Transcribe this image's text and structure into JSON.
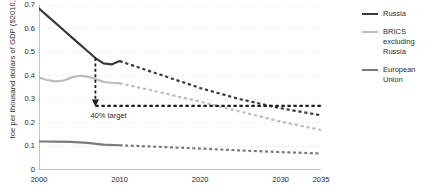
{
  "chart_data": {
    "type": "line",
    "title": "",
    "xlabel": "",
    "ylabel": "toe per thousand dollars of GDP ($2010, MER)",
    "xlim": [
      2000,
      2035
    ],
    "ylim": [
      0,
      0.7
    ],
    "grid": true,
    "legend_position": "right",
    "xticks": [
      2000,
      2005,
      2010,
      2015,
      2020,
      2025,
      2030,
      2035
    ],
    "xticklabels": [
      "2000",
      "",
      "2010",
      "",
      "2020",
      "",
      "2030",
      "2035"
    ],
    "yticks": [
      0,
      0.1,
      0.2,
      0.3,
      0.4,
      0.5,
      0.6,
      0.7
    ],
    "yticklabels": [
      "0",
      "0.1",
      "0.2",
      "0.3",
      "0.4",
      "0.5",
      "0.6",
      "0.7"
    ],
    "series": [
      {
        "name": "Russia",
        "color": "#3a3a3a",
        "historical": {
          "x": [
            2000,
            2001,
            2002,
            2003,
            2004,
            2005,
            2006,
            2007,
            2008,
            2009,
            2010
          ],
          "y": [
            0.685,
            0.655,
            0.625,
            0.595,
            0.565,
            0.535,
            0.505,
            0.475,
            0.452,
            0.448,
            0.462
          ]
        },
        "projection": {
          "x": [
            2010,
            2015,
            2020,
            2025,
            2030,
            2035
          ],
          "y": [
            0.462,
            0.405,
            0.348,
            0.3,
            0.262,
            0.232
          ]
        }
      },
      {
        "name": "BRICS excluding Russia",
        "color": "#bdbdbd",
        "historical": {
          "x": [
            2000,
            2001,
            2002,
            2003,
            2004,
            2005,
            2006,
            2007,
            2008,
            2009,
            2010
          ],
          "y": [
            0.392,
            0.382,
            0.376,
            0.379,
            0.392,
            0.4,
            0.396,
            0.386,
            0.374,
            0.37,
            0.368
          ]
        },
        "projection": {
          "x": [
            2010,
            2015,
            2020,
            2025,
            2030,
            2035
          ],
          "y": [
            0.368,
            0.33,
            0.29,
            0.248,
            0.205,
            0.17
          ]
        }
      },
      {
        "name": "European Union",
        "color": "#7a7a7a",
        "historical": {
          "x": [
            2000,
            2002,
            2004,
            2006,
            2008,
            2010
          ],
          "y": [
            0.121,
            0.12,
            0.119,
            0.115,
            0.108,
            0.105
          ]
        },
        "projection": {
          "x": [
            2010,
            2015,
            2020,
            2025,
            2030,
            2035
          ],
          "y": [
            0.105,
            0.098,
            0.091,
            0.083,
            0.076,
            0.07
          ]
        }
      }
    ],
    "annotations": [
      {
        "name": "40% target",
        "label": "40% target",
        "target_value": 0.272,
        "arrow_from": {
          "x": 2007,
          "y": 0.475
        },
        "arrow_to": {
          "x": 2007,
          "y": 0.272
        },
        "target_line_from_x": 2007,
        "target_line_to_x": 2035
      }
    ]
  },
  "legend": {
    "entries": [
      {
        "label": "Russia",
        "color": "#3a3a3a"
      },
      {
        "label": "BRICS excluding Russia",
        "color": "#bdbdbd"
      },
      {
        "label": "European Union",
        "color": "#7a7a7a"
      }
    ]
  },
  "axis": {
    "y_title": "toe per thousand dollars of GDP ($2010, MER)"
  }
}
